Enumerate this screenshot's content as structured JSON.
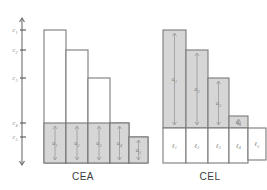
{
  "figure": {
    "panels": [
      {
        "id": "cea",
        "caption": "CEA",
        "caption_x": 83,
        "caption_y": 180,
        "has_axis": true,
        "axis": {
          "x": 22,
          "y_top": 18,
          "y_bottom": 165,
          "tick_len": 4,
          "ticks": [
            {
              "label": "c",
              "sub": "1",
              "y": 30
            },
            {
              "label": "c",
              "sub": "2",
              "y": 50
            },
            {
              "label": "c",
              "sub": "3",
              "y": 78
            },
            {
              "label": "c",
              "sub": "4",
              "y": 123
            },
            {
              "label": "c",
              "sub": "5",
              "y": 137
            }
          ]
        },
        "baseline_y": 163,
        "bars": [
          {
            "x": 44,
            "w": 22,
            "top_y": 30,
            "fill_top_y": 123,
            "label": "a",
            "sub": "1"
          },
          {
            "x": 66,
            "w": 22,
            "top_y": 50,
            "fill_top_y": 123,
            "label": "a",
            "sub": "2"
          },
          {
            "x": 88,
            "w": 22,
            "top_y": 78,
            "fill_top_y": 123,
            "label": "a",
            "sub": "3"
          },
          {
            "x": 110,
            "w": 19,
            "top_y": 123,
            "fill_top_y": 123,
            "label": "a",
            "sub": "4"
          },
          {
            "x": 129,
            "w": 19,
            "top_y": 137,
            "fill_top_y": 137,
            "label": "a",
            "sub": "5"
          }
        ]
      },
      {
        "id": "cel",
        "caption": "CEL",
        "caption_x": 210,
        "caption_y": 180,
        "has_axis": false,
        "baseline_y": 163,
        "split_y": 128,
        "bars": [
          {
            "x": 163,
            "w": 23,
            "top_y": 30,
            "award_label": "a",
            "award_sub": "1",
            "loss_label": "ℓ",
            "loss_sub": "1",
            "loss_bottom_y": 163
          },
          {
            "x": 186,
            "w": 22,
            "top_y": 50,
            "award_label": "a",
            "award_sub": "2",
            "loss_label": "ℓ",
            "loss_sub": "2",
            "loss_bottom_y": 163
          },
          {
            "x": 208,
            "w": 21,
            "top_y": 78,
            "award_label": "a",
            "award_sub": "3",
            "loss_label": "ℓ",
            "loss_sub": "3",
            "loss_bottom_y": 163
          },
          {
            "x": 229,
            "w": 19,
            "top_y": 116,
            "award_label": "a",
            "award_sub": "4",
            "loss_label": "ℓ",
            "loss_sub": "4",
            "loss_bottom_y": 163
          },
          {
            "x": 248,
            "w": 18,
            "top_y": 128,
            "award_label": "",
            "award_sub": "",
            "loss_label": "ℓ",
            "loss_sub": "5",
            "loss_bottom_y": 160
          }
        ]
      }
    ]
  },
  "chart_data": {
    "type": "bar",
    "title": "",
    "xlabel": "",
    "ylabel": "",
    "grid": false,
    "legend": "none",
    "panels": [
      {
        "name": "CEA",
        "categories": [
          "1",
          "2",
          "3",
          "4",
          "5"
        ],
        "axis_tick_labels": [
          "c1",
          "c2",
          "c3",
          "c4",
          "c5"
        ],
        "series": [
          {
            "name": "claim c_i (full bar height)",
            "values": [
              133,
              113,
              85,
              40,
              26
            ]
          },
          {
            "name": "award a_i (shaded part)",
            "values": [
              40,
              40,
              40,
              40,
              26
            ]
          }
        ]
      },
      {
        "name": "CEL",
        "categories": [
          "1",
          "2",
          "3",
          "4",
          "5"
        ],
        "series": [
          {
            "name": "award a_i (shaded top)",
            "values": [
              98,
              78,
              50,
              12,
              0
            ]
          },
          {
            "name": "loss l_i (white bottom)",
            "values": [
              35,
              35,
              35,
              35,
              32
            ]
          }
        ]
      }
    ]
  }
}
